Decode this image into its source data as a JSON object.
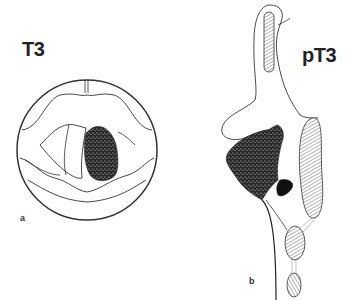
{
  "figure": {
    "panel_a": {
      "title": "T3",
      "letter": "a",
      "view": "laryngoscopic view",
      "tumor_color": "#2a2a2a"
    },
    "panel_b": {
      "title": "pT3",
      "letter": "b",
      "view": "coronal section",
      "tumor_color": "#2a2a2a",
      "hatch_color": "#444444"
    },
    "line_color": "#333333",
    "background": "#ffffff"
  }
}
